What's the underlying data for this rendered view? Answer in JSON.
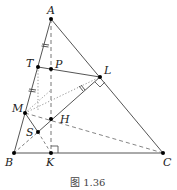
{
  "figure": {
    "caption": "图 1.36",
    "points": {
      "A": {
        "label": "A",
        "x": 51,
        "y": 19
      },
      "B": {
        "label": "B",
        "x": 14,
        "y": 153
      },
      "C": {
        "label": "C",
        "x": 163,
        "y": 153
      },
      "K": {
        "label": "K",
        "x": 51,
        "y": 153
      },
      "T": {
        "label": "T",
        "x": 38,
        "y": 67
      },
      "P": {
        "label": "P",
        "x": 51,
        "y": 69
      },
      "L": {
        "label": "L",
        "x": 100,
        "y": 77
      },
      "M": {
        "label": "M",
        "x": 25,
        "y": 113
      },
      "H": {
        "label": "H",
        "x": 51,
        "y": 119
      },
      "S": {
        "label": "S",
        "x": 38,
        "y": 132
      }
    },
    "colors": {
      "stroke": "#555555",
      "point": "#000000"
    }
  }
}
